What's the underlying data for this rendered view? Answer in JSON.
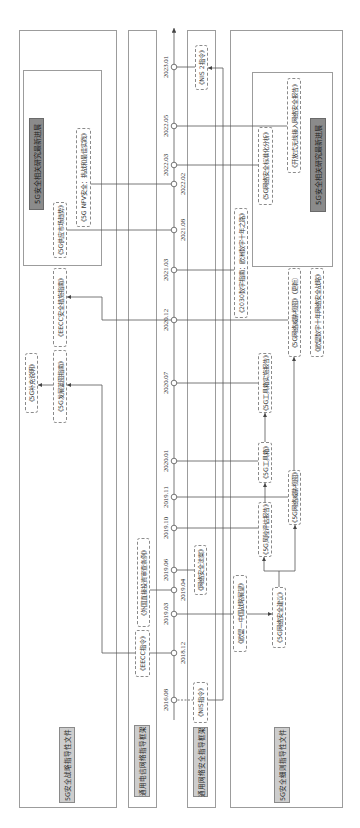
{
  "lanes": {
    "strategy": {
      "label": "5G安全战略指导性文件",
      "latest_label": "5G安全相关研究最新进展"
    },
    "telecom": {
      "label": "通用电信网络指导框架"
    },
    "cybersecurity": {
      "label": "通用网络安全指导框架"
    },
    "details": {
      "label": "5G安全细则指导性文件",
      "latest_label": "5G安全相关研究最新进展"
    }
  },
  "documents": {
    "strategy": {
      "nfv_security": "《5G NFV安全：挑战和最佳实践》",
      "supply_market_trends": "《5G供应市场趋势》",
      "eecc_security_guide": "《EECC安全措施指南》",
      "supplement": "《5G补充说明》",
      "development_guide": "《5G发展蓝图指南》"
    },
    "telecom": {
      "eecc_directive": "《EECC指令》",
      "fdi_screening": "《外国直接投资审查条例》"
    },
    "cybersecurity": {
      "nis_directive": "《NIS指令》",
      "cybersecurity_act": "《网络安全法案》",
      "nis2_directive": "《NIS 2指令》"
    },
    "details": {
      "open_ran_report": "《开放式无线接入网络安全报告》",
      "standardization_analysis": "《5G网络安全标准化分析》",
      "digital_compass": "《2030数字指南：欧洲数字十年之路》",
      "threat_landscape_update": "《5G网络威胁视图》（更新）",
      "cybersecurity_strategy": "《欧盟数字十年网络安全战略》",
      "toolbox_report": "《5G工具箱实施报告》",
      "toolbox": "《5G工具箱》",
      "risk_assessment": "《5G风险评估报告》",
      "threat_landscape": "《5G网络威胁视图》",
      "eu_china_outlook": "《欧盟—中国战略展望》",
      "cybersecurity_recommendation": "《5G网络安全建议》"
    }
  },
  "timeline": {
    "dates": [
      "2016.08",
      "2018.12",
      "2019.03",
      "2019.04",
      "2019.06",
      "2019.10",
      "2019.11",
      "2020.01",
      "2020.07",
      "2020.12",
      "2021.03",
      "2021.08",
      "2022.02",
      "2022.03",
      "2022.05",
      "2023.01"
    ]
  },
  "connections": [
    {
      "date": "2016.08",
      "to": "《NIS指令》",
      "style": "dashed"
    },
    {
      "date": "2018.12",
      "to": "《EECC指令》"
    },
    {
      "date": "2019.03",
      "to": "《欧盟—中国战略展望》"
    },
    {
      "date": "2019.04",
      "to": "《外国直接投资审查条例》"
    },
    {
      "date": "2019.06",
      "to": "《网络安全法案》"
    },
    {
      "date": "2019.10",
      "to": "《5G风险评估报告》"
    },
    {
      "date": "2019.11",
      "to": "《5G网络威胁视图》"
    },
    {
      "date": "2020.01",
      "to": "《5G工具箱》"
    },
    {
      "date": "2020.07",
      "to": "《5G工具箱实施报告》"
    },
    {
      "date": "2020.12",
      "to": [
        "《5G网络威胁视图》（更新）",
        "《EECC安全措施指南》"
      ]
    },
    {
      "date": "2021.03",
      "to": "《2030数字指南：欧洲数字十年之路》"
    },
    {
      "date": "2021.08",
      "to": "《5G供应市场趋势》"
    },
    {
      "date": "2022.02",
      "to": "《5G NFV安全：挑战和最佳实践》"
    },
    {
      "date": "2022.03",
      "to": "《5G网络安全标准化分析》"
    },
    {
      "date": "2022.05",
      "to": "《开放式无线接入网络安全报告》"
    },
    {
      "date": "2023.01",
      "to": "《NIS 2指令》"
    }
  ],
  "arrows": [
    {
      "from": "《NIS指令》",
      "to": "《NIS 2指令》"
    },
    {
      "from": "《EECC指令》",
      "to": "《5G发展蓝图指南》"
    },
    {
      "from": "《5G发展蓝图指南》",
      "to": "《5G补充说明》"
    },
    {
      "from": "《欧盟—中国战略展望》",
      "to": "《5G网络安全建议》"
    },
    {
      "from": "《5G网络安全建议》",
      "to": "《5G风险评估报告》"
    },
    {
      "from": "《5G网络安全建议》",
      "to": "《5G网络威胁视图》"
    },
    {
      "from": "《5G风险评估报告》",
      "to": "《5G工具箱》"
    },
    {
      "from": "《5G工具箱》",
      "to": "《5G工具箱实施报告》"
    },
    {
      "from": "《5G网络威胁视图》",
      "to": "《5G网络威胁视图》（更新）"
    }
  ],
  "colors": {
    "line": "#555555",
    "panel_border": "#9c9c9c",
    "latest_label_fill": "#8b8b8b",
    "category_label_fill": "#cdcdcd",
    "doc_border": "#8a8a8a"
  }
}
